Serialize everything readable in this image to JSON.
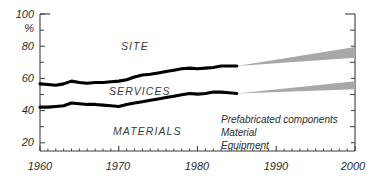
{
  "chart_data": {
    "type": "area",
    "title": "",
    "subtitle": "",
    "xlabel": "",
    "ylabel": "%",
    "xlim": [
      1960,
      2000
    ],
    "ylim": [
      0,
      100
    ],
    "grid": false,
    "legend_position": "inline-annotations",
    "y_ticks": [
      20,
      40,
      60,
      80,
      100
    ],
    "y_tick_labels": [
      "20",
      "40",
      "60",
      "80",
      "100"
    ],
    "y_minor_tick_step": 10,
    "x_ticks": [
      1960,
      1970,
      1980,
      1990,
      2000
    ],
    "x_tick_labels": [
      "1960",
      "1970",
      "1980",
      "1990",
      "2000"
    ],
    "x_minor_tick_step": 1,
    "units": "%",
    "band_labels": [
      "SITE",
      "SERVICES",
      "MATERIALS"
    ],
    "annotations": [
      "Prefabricated components",
      "Material",
      "Equipment"
    ],
    "series": [
      {
        "name": "SERVICES upper boundary (SITE lower edge)",
        "style": "solid-thick-black",
        "x": [
          1960,
          1961,
          1962,
          1963,
          1964,
          1965,
          1966,
          1967,
          1968,
          1969,
          1970,
          1971,
          1972,
          1973,
          1974,
          1975,
          1976,
          1977,
          1978,
          1979,
          1980,
          1981,
          1982,
          1983,
          1984,
          1985
        ],
        "values": [
          49,
          48.5,
          48,
          49,
          51,
          50,
          49.5,
          50,
          50,
          50.5,
          51,
          52,
          54,
          55.5,
          56,
          57,
          58,
          59,
          60,
          60.5,
          60,
          60.5,
          61,
          62,
          62,
          62
        ]
      },
      {
        "name": "MATERIALS upper boundary (SERVICES lower edge)",
        "style": "solid-thick-black",
        "x": [
          1960,
          1961,
          1962,
          1963,
          1964,
          1965,
          1966,
          1967,
          1968,
          1969,
          1970,
          1971,
          1972,
          1973,
          1974,
          1975,
          1976,
          1977,
          1978,
          1979,
          1980,
          1981,
          1982,
          1983,
          1984,
          1985
        ],
        "values": [
          32,
          32,
          32.5,
          33,
          35,
          34.5,
          34,
          34,
          33.5,
          33,
          32.5,
          34,
          35,
          36,
          37,
          38,
          39,
          40,
          41,
          42,
          41.5,
          42,
          43,
          43,
          42.5,
          42
        ]
      }
    ],
    "projection": {
      "start_year": 1985,
      "end_year": 2000,
      "wedges": [
        {
          "name": "upper-projection-fan",
          "color": "#a8a8a8",
          "start_value": 62,
          "end_low": 68,
          "end_high": 76
        },
        {
          "name": "lower-projection-fan",
          "color": "#a8a8a8",
          "start_value": 42,
          "end_low": 45,
          "end_high": 51
        }
      ]
    }
  },
  "colors": {
    "line": "#000000",
    "wedge": "#a8a8a8",
    "axis": "#3c3c3c",
    "text": "#2b2b2b",
    "background": "#ffffff"
  }
}
